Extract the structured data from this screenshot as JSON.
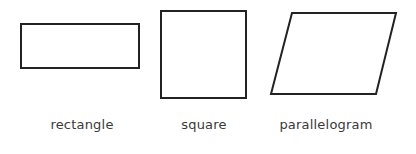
{
  "diagram": {
    "stroke_color": "#222222",
    "label_color": "#3a3a3a",
    "shapes": [
      {
        "name": "rectangle",
        "label": "rectangle",
        "points": "21,24 139,24 139,68 21,68"
      },
      {
        "name": "square",
        "label": "square",
        "points": "161,11 246,11 246,98 161,98"
      },
      {
        "name": "parallelogram",
        "label": "parallelogram",
        "points": "292,13 396,13 376,94 271,94"
      }
    ]
  }
}
